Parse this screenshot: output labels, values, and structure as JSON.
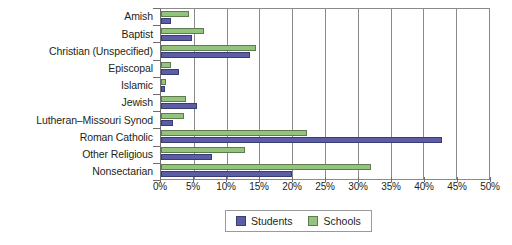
{
  "chart_data": {
    "type": "bar",
    "orientation": "horizontal",
    "title": "",
    "subtitle": "",
    "xlabel": "",
    "ylabel": "",
    "xlim": [
      0,
      50
    ],
    "xtick_labels": [
      "0%",
      "5%",
      "10%",
      "15%",
      "20%",
      "25%",
      "30%",
      "35%",
      "40%",
      "45%",
      "50%"
    ],
    "xtick_values": [
      0,
      5,
      10,
      15,
      20,
      25,
      30,
      35,
      40,
      45,
      50
    ],
    "grid": true,
    "grid_axis": "x",
    "legend_position": "bottom",
    "categories": [
      "Amish",
      "Baptist",
      "Christian (Unspecified)",
      "Episcopal",
      "Islamic",
      "Jewish",
      "Lutheran–Missouri Synod",
      "Roman Catholic",
      "Other Religious",
      "Nonsectarian"
    ],
    "series": [
      {
        "name": "Students",
        "color": "#5b5ea6",
        "values": [
          1.5,
          4.7,
          13.5,
          2.8,
          0.6,
          5.5,
          1.8,
          42.8,
          7.8,
          20.0
        ]
      },
      {
        "name": "Schools",
        "color": "#93c47d",
        "values": [
          4.3,
          6.5,
          14.5,
          1.5,
          0.7,
          3.8,
          3.5,
          22.3,
          12.8,
          32.0
        ]
      }
    ]
  },
  "legend": {
    "items": [
      {
        "label": "Students",
        "swatch": "students"
      },
      {
        "label": "Schools",
        "swatch": "schools"
      }
    ]
  },
  "colors": {
    "students": "#5b5ea6",
    "schools": "#93c47d",
    "axis": "#6e6e6e",
    "grid": "#8a8a8a",
    "text": "#231f20",
    "background": "#ffffff"
  }
}
